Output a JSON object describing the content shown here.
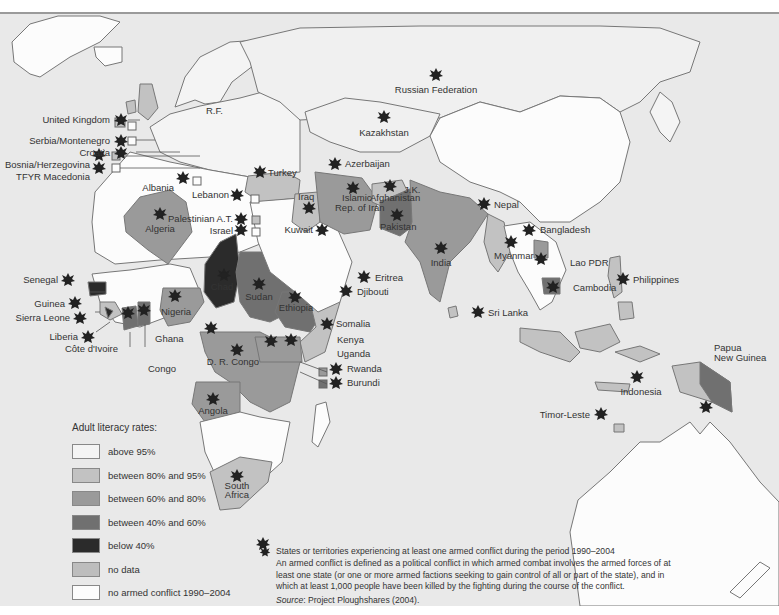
{
  "map": {
    "labels": {
      "united_kingdom": "United Kingdom",
      "serbia_montenegro": "Serbia/Montenegro",
      "croatia": "Croatia",
      "bosnia": "Bosnia/Herzegovina",
      "macedonia": "TFYR Macedonia",
      "albania": "Albania",
      "lebanon": "Lebanon",
      "palestinian": "Palestinian A.T.",
      "israel": "Israel",
      "turkey": "Turkey",
      "azerbaijan": "Azerbaijan",
      "iraq": "Iraq",
      "iran_1": "Islamic",
      "iran_2": "Rep. of Iran",
      "afghanistan": "Afghanistan",
      "jk": "J.K.",
      "pakistan": "Pakistan",
      "kuwait": "Kuwait",
      "algeria": "Algeria",
      "rf": "R.F.",
      "russia": "Russian Federation",
      "kazakhstan": "Kazakhstan",
      "nepal": "Nepal",
      "bangladesh": "Bangladesh",
      "india": "India",
      "myanmar": "Myanmar",
      "lao": "Lao PDR",
      "cambodia": "Cambodia",
      "philippines": "Philippines",
      "sri_lanka": "Sri Lanka",
      "senegal": "Senegal",
      "guinea": "Guinea",
      "sierra_leone": "Sierra Leone",
      "liberia": "Liberia",
      "cote_divoire": "Côte d'Ivoire",
      "ghana": "Ghana",
      "nigeria": "Nigeria",
      "chad": "Chad",
      "sudan": "Sudan",
      "eritrea": "Eritrea",
      "djibouti": "Djibouti",
      "ethiopia": "Ethiopia",
      "somalia": "Somalia",
      "kenya": "Kenya",
      "uganda": "Uganda",
      "rwanda": "Rwanda",
      "burundi": "Burundi",
      "congo": "Congo",
      "drc": "D. R. Congo",
      "angola": "Angola",
      "south_africa_1": "South",
      "south_africa_2": "Africa",
      "indonesia": "Indonesia",
      "png_1": "Papua",
      "png_2": "New Guinea",
      "timor": "Timor-Leste"
    }
  },
  "legend": {
    "title": "Adult literacy rates:",
    "items": [
      {
        "label": "above 95%",
        "color": "#f4f4f4"
      },
      {
        "label": "between 80% and 95%",
        "color": "#c2c2c2"
      },
      {
        "label": "between 60% and 80%",
        "color": "#9a9a9a"
      },
      {
        "label": "between 40% and 60%",
        "color": "#707070"
      },
      {
        "label": "below 40%",
        "color": "#2b2b2b"
      },
      {
        "label": "no data",
        "color": "#bdbdbd"
      },
      {
        "label": "no armed conflict 1990–2004",
        "color": "#fcfcfc"
      }
    ]
  },
  "note": {
    "star_label": "States or territories experiencing at least one armed conflict during the period 1990–2004",
    "definition": "An armed conflict is defined as a political conflict in which armed combat involves the armed forces of at least one state (or one or more armed factions seeking to gain control of all or part of the state), and in which at least 1,000 people have been killed by the fighting during the course of the conflict.",
    "source_label": "Source",
    "source_text": ": Project Ploughshares (2004)."
  }
}
